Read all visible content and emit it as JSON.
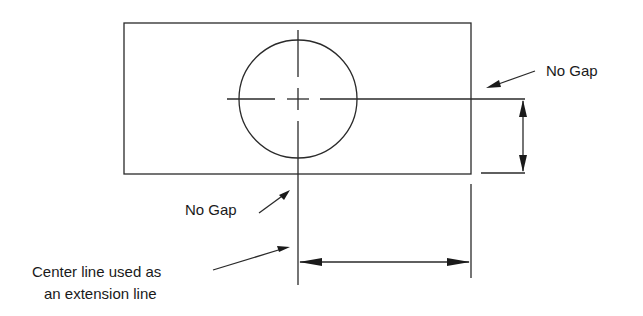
{
  "diagram": {
    "type": "technical-drawing",
    "stroke_color": "#2a2a2a",
    "labels": {
      "no_gap_right": "No Gap",
      "no_gap_bottom": "No Gap",
      "center_line_line1": "Center line used as",
      "center_line_line2": "an extension line"
    },
    "elements": [
      {
        "name": "part-outline",
        "shape": "rectangle"
      },
      {
        "name": "hole",
        "shape": "circle"
      },
      {
        "name": "horizontal-center-line"
      },
      {
        "name": "vertical-center-line"
      },
      {
        "name": "vertical-dimension",
        "orientation": "vertical"
      },
      {
        "name": "horizontal-dimension",
        "orientation": "horizontal"
      }
    ]
  }
}
